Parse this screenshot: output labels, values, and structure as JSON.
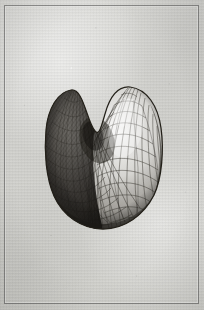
{
  "plate": {
    "medium": "engraving",
    "caption": "",
    "title": "",
    "background_color": "#d2d2ce",
    "frame_color": "#4a4a4a",
    "ink_color": "#2a2724"
  },
  "figure": {
    "name": "bilobed-mesh-ovoid",
    "shape": "bilobed-ovoid",
    "surface": "triangulated-mesh",
    "bounds": {
      "x": 45,
      "y": 86,
      "width": 118,
      "height": 144
    },
    "lobes": [
      {
        "name": "left-lobe",
        "apex_x": 71,
        "apex_y": 90,
        "shading": "dark"
      },
      {
        "name": "right-lobe",
        "apex_x": 128,
        "apex_y": 87,
        "shading": "light"
      }
    ],
    "cleft": {
      "x": 101,
      "y": 139,
      "label": "median-cleft"
    },
    "light_direction": "upper-right",
    "mesh": {
      "meridians": 30,
      "parallels": 22,
      "cell": "triangle"
    }
  }
}
